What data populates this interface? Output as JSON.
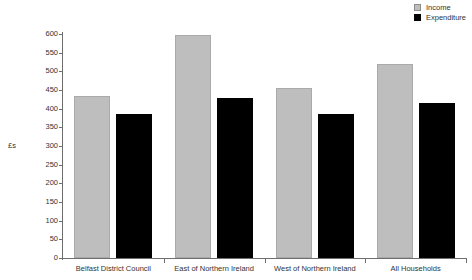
{
  "chart_data": {
    "type": "bar",
    "title": "",
    "subtitle": "",
    "xlabel": "",
    "ylabel": "£s",
    "ylim": [
      0,
      600
    ],
    "grid": false,
    "legend_position": "top-right",
    "categories": [
      "Belfast District Council",
      "East of Northern Ireland",
      "West of Northern Ireland",
      "All Households"
    ],
    "yticks": [
      0,
      50,
      100,
      150,
      200,
      250,
      300,
      350,
      400,
      450,
      500,
      550,
      600
    ],
    "series": [
      {
        "name": "Income",
        "color": "#bebebe",
        "values": [
          434,
          598,
          456,
          519
        ]
      },
      {
        "name": "Expenditure",
        "color": "#000000",
        "values": [
          385,
          428,
          387,
          415
        ]
      }
    ]
  },
  "legend": {
    "items": [
      {
        "label": "Income",
        "swatch": "legend-swatch-income"
      },
      {
        "label": "Expenditure",
        "swatch": "legend-swatch-expenditure"
      }
    ]
  }
}
